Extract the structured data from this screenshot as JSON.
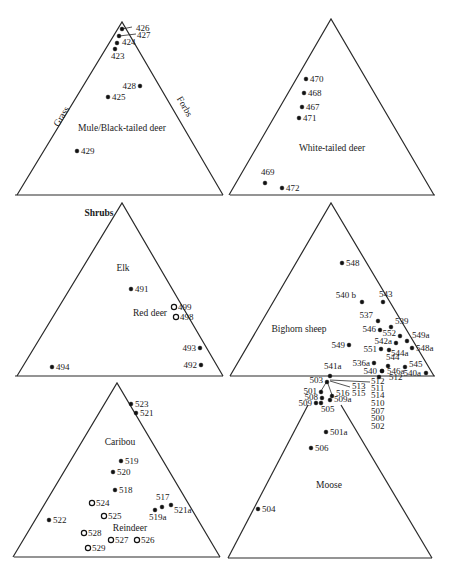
{
  "figure": {
    "axis_labels": {
      "left": "Grass",
      "right": "Forbs",
      "bottom": "Shrubs"
    },
    "point_style_legend": {
      "filled": "wild / primary species",
      "open": "secondary species (Red deer, Reindeer)"
    }
  },
  "chart_data": [
    {
      "type": "ternary-scatter",
      "title": "Mule/Black-tailed deer",
      "axes": {
        "left": "Grass",
        "right": "Forbs",
        "bottom": "Shrubs"
      },
      "points": [
        {
          "label": "426",
          "x": 122,
          "y": 29,
          "marker": "filled"
        },
        {
          "label": "427",
          "x": 119,
          "y": 36,
          "marker": "filled"
        },
        {
          "label": "424",
          "x": 117,
          "y": 43,
          "marker": "filled"
        },
        {
          "label": "423",
          "x": 115,
          "y": 49,
          "marker": "filled"
        },
        {
          "label": "428",
          "x": 140,
          "y": 86,
          "marker": "filled"
        },
        {
          "label": "425",
          "x": 108,
          "y": 97,
          "marker": "filled"
        },
        {
          "label": "429",
          "x": 77,
          "y": 151,
          "marker": "filled"
        }
      ]
    },
    {
      "type": "ternary-scatter",
      "title": "White-tailed deer",
      "axes": {
        "left": "Grass",
        "right": "Forbs",
        "bottom": "Shrubs"
      },
      "points": [
        {
          "label": "470",
          "x": 306,
          "y": 79,
          "marker": "filled"
        },
        {
          "label": "468",
          "x": 304,
          "y": 93,
          "marker": "filled"
        },
        {
          "label": "467",
          "x": 302,
          "y": 107,
          "marker": "filled"
        },
        {
          "label": "471",
          "x": 299,
          "y": 118,
          "marker": "filled"
        },
        {
          "label": "469",
          "x": 265,
          "y": 183,
          "marker": "filled"
        },
        {
          "label": "472",
          "x": 282,
          "y": 188,
          "marker": "filled"
        }
      ]
    },
    {
      "type": "ternary-scatter",
      "title": "Elk",
      "secondary_title": "Red deer",
      "axes": {
        "left": "Grass",
        "right": "Forbs",
        "bottom": "Shrubs"
      },
      "points": [
        {
          "label": "491",
          "x": 131,
          "y": 289,
          "marker": "filled"
        },
        {
          "label": "499",
          "x": 174,
          "y": 307,
          "marker": "open"
        },
        {
          "label": "498",
          "x": 176,
          "y": 317,
          "marker": "open"
        },
        {
          "label": "493",
          "x": 200,
          "y": 348,
          "marker": "filled"
        },
        {
          "label": "492",
          "x": 201,
          "y": 365,
          "marker": "filled"
        },
        {
          "label": "494",
          "x": 52,
          "y": 367,
          "marker": "filled"
        }
      ]
    },
    {
      "type": "ternary-scatter",
      "title": "Bighorn sheep",
      "axes": {
        "left": "Grass",
        "right": "Forbs",
        "bottom": "Shrubs"
      },
      "points": [
        {
          "label": "548",
          "x": 342,
          "y": 263,
          "marker": "filled"
        },
        {
          "label": "540 b",
          "x": 362,
          "y": 302,
          "marker": "filled"
        },
        {
          "label": "543",
          "x": 383,
          "y": 302,
          "marker": "filled"
        },
        {
          "label": "537",
          "x": 378,
          "y": 321,
          "marker": "filled"
        },
        {
          "label": "539",
          "x": 391,
          "y": 327,
          "marker": "filled"
        },
        {
          "label": "546",
          "x": 380,
          "y": 330,
          "marker": "filled"
        },
        {
          "label": "552",
          "x": 400,
          "y": 336,
          "marker": "filled"
        },
        {
          "label": "542a",
          "x": 396,
          "y": 343,
          "marker": "filled"
        },
        {
          "label": "549a",
          "x": 407,
          "y": 341,
          "marker": "filled"
        },
        {
          "label": "548a",
          "x": 412,
          "y": 348,
          "marker": "filled"
        },
        {
          "label": "549",
          "x": 349,
          "y": 345,
          "marker": "filled"
        },
        {
          "label": "551",
          "x": 381,
          "y": 349,
          "marker": "filled"
        },
        {
          "label": "544a",
          "x": 389,
          "y": 350,
          "marker": "filled"
        },
        {
          "label": "536a",
          "x": 374,
          "y": 363,
          "marker": "filled"
        },
        {
          "label": "544",
          "x": 388,
          "y": 366,
          "marker": "filled"
        },
        {
          "label": "545",
          "x": 405,
          "y": 367,
          "marker": "filled"
        },
        {
          "label": "540",
          "x": 382,
          "y": 371,
          "marker": "filled"
        },
        {
          "label": "546a",
          "x": 382,
          "y": 371,
          "marker": "filled"
        },
        {
          "label": "540a",
          "x": 426,
          "y": 373,
          "marker": "filled"
        },
        {
          "label": "541a",
          "x": 330,
          "y": 376,
          "marker": "filled"
        },
        {
          "label": "512",
          "x": 379,
          "y": 377,
          "marker": "filled"
        }
      ]
    },
    {
      "type": "ternary-scatter",
      "title": "Caribou",
      "secondary_title": "Reindeer",
      "axes": {
        "left": "Grass",
        "right": "Forbs",
        "bottom": "Shrubs"
      },
      "points": [
        {
          "label": "523",
          "x": 131,
          "y": 404,
          "marker": "filled"
        },
        {
          "label": "521",
          "x": 136,
          "y": 413,
          "marker": "filled"
        },
        {
          "label": "519",
          "x": 121,
          "y": 461,
          "marker": "filled"
        },
        {
          "label": "520",
          "x": 113,
          "y": 472,
          "marker": "filled"
        },
        {
          "label": "518",
          "x": 115,
          "y": 490,
          "marker": "filled"
        },
        {
          "label": "524",
          "x": 92,
          "y": 503,
          "marker": "open"
        },
        {
          "label": "517",
          "x": 162,
          "y": 507,
          "marker": "filled"
        },
        {
          "label": "521a",
          "x": 171,
          "y": 505,
          "marker": "filled"
        },
        {
          "label": "519a",
          "x": 155,
          "y": 510,
          "marker": "filled"
        },
        {
          "label": "525",
          "x": 104,
          "y": 516,
          "marker": "open"
        },
        {
          "label": "522",
          "x": 49,
          "y": 520,
          "marker": "filled"
        },
        {
          "label": "528",
          "x": 84,
          "y": 533,
          "marker": "open"
        },
        {
          "label": "527",
          "x": 111,
          "y": 540,
          "marker": "open"
        },
        {
          "label": "526",
          "x": 137,
          "y": 540,
          "marker": "open"
        },
        {
          "label": "529",
          "x": 88,
          "y": 548,
          "marker": "open"
        }
      ]
    },
    {
      "type": "ternary-scatter",
      "title": "Moose",
      "axes": {
        "left": "Grass",
        "right": "Forbs",
        "bottom": "Shrubs"
      },
      "points": [
        {
          "label": "503",
          "x": 327,
          "y": 382,
          "marker": "filled"
        },
        {
          "label": "501",
          "x": 321,
          "y": 392,
          "marker": "filled"
        },
        {
          "label": "516",
          "x": 332,
          "y": 396,
          "marker": "filled"
        },
        {
          "label": "508",
          "x": 322,
          "y": 398,
          "marker": "filled"
        },
        {
          "label": "509a",
          "x": 330,
          "y": 400,
          "marker": "filled"
        },
        {
          "label": "509",
          "x": 316,
          "y": 403,
          "marker": "filled"
        },
        {
          "label": "505",
          "x": 321,
          "y": 403,
          "marker": "filled"
        },
        {
          "label": "501a",
          "x": 326,
          "y": 432,
          "marker": "filled"
        },
        {
          "label": "506",
          "x": 311,
          "y": 448,
          "marker": "filled"
        },
        {
          "label": "504",
          "x": 258,
          "y": 509,
          "marker": "filled"
        }
      ],
      "stacked_labels_right": [
        "513",
        "515",
        "512",
        "511",
        "514",
        "510",
        "507",
        "500",
        "502"
      ]
    }
  ]
}
